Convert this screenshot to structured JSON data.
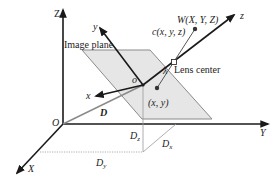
{
  "diagram": {
    "colors": {
      "axis": "#1a1a1a",
      "plane_fill": "#e6e6e6",
      "plane_stroke": "#8a8a8a",
      "d_line": "#8a8a8a",
      "dotted": "#9a9a9a"
    },
    "world_axes": {
      "Z": "Z",
      "Y": "Y",
      "X": "X",
      "origin": "O"
    },
    "camera_axes": {
      "x": "x",
      "y": "y",
      "z": "z",
      "origin": "o"
    },
    "labels": {
      "image_plane": "Image plane",
      "lens_center": "Lens center",
      "lambda": "λ",
      "world_point": "W(X, Y, Z)",
      "camera_point": "c(x, y, z)",
      "image_point": "(x, y)",
      "displacement": "D",
      "dz_main": "D",
      "dz_sub": "z",
      "dx_main": "D",
      "dx_sub": "x",
      "dy_main": "D",
      "dy_sub": "y"
    }
  }
}
